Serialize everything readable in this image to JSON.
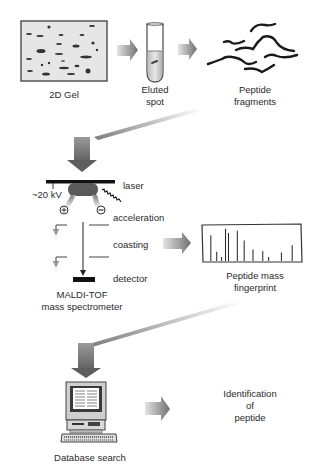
{
  "diagram": {
    "steps": [
      {
        "id": "gel",
        "label": "2D Gel"
      },
      {
        "id": "eluted",
        "label_line1": "Eluted",
        "label_line2": "spot"
      },
      {
        "id": "fragments",
        "label_line1": "Peptide",
        "label_line2": "fragments"
      },
      {
        "id": "maldi",
        "label_line1": "MALDI-TOF",
        "label_line2": "mass spectrometer"
      },
      {
        "id": "fingerprint",
        "label_line1": "Peptide mass",
        "label_line2": "fingerprint"
      },
      {
        "id": "database",
        "label": "Database search"
      },
      {
        "id": "identification",
        "label_line1": "Identification",
        "label_line2": "of",
        "label_line3": "peptide"
      }
    ],
    "maldi_parts": {
      "voltage": "~20 kV",
      "laser": "laser",
      "acceleration": "acceleration",
      "coasting": "coasting",
      "detector": "detector",
      "plus": "+",
      "minus": "−"
    },
    "spectrum_peaks": [
      {
        "x": 0.08,
        "h": 0.78
      },
      {
        "x": 0.14,
        "h": 0.28
      },
      {
        "x": 0.19,
        "h": 0.12
      },
      {
        "x": 0.23,
        "h": 0.98
      },
      {
        "x": 0.26,
        "h": 0.85
      },
      {
        "x": 0.35,
        "h": 0.92
      },
      {
        "x": 0.42,
        "h": 0.62
      },
      {
        "x": 0.51,
        "h": 0.35
      },
      {
        "x": 0.61,
        "h": 0.3
      },
      {
        "x": 0.67,
        "h": 0.12
      },
      {
        "x": 0.8,
        "h": 0.26
      },
      {
        "x": 0.91,
        "h": 0.48
      }
    ],
    "colors": {
      "arrow_dark": "#6f6f6f",
      "arrow_light": "#e0e0e0",
      "ink": "#1a1a1a",
      "gel_fill": "#e6e6e6"
    }
  }
}
